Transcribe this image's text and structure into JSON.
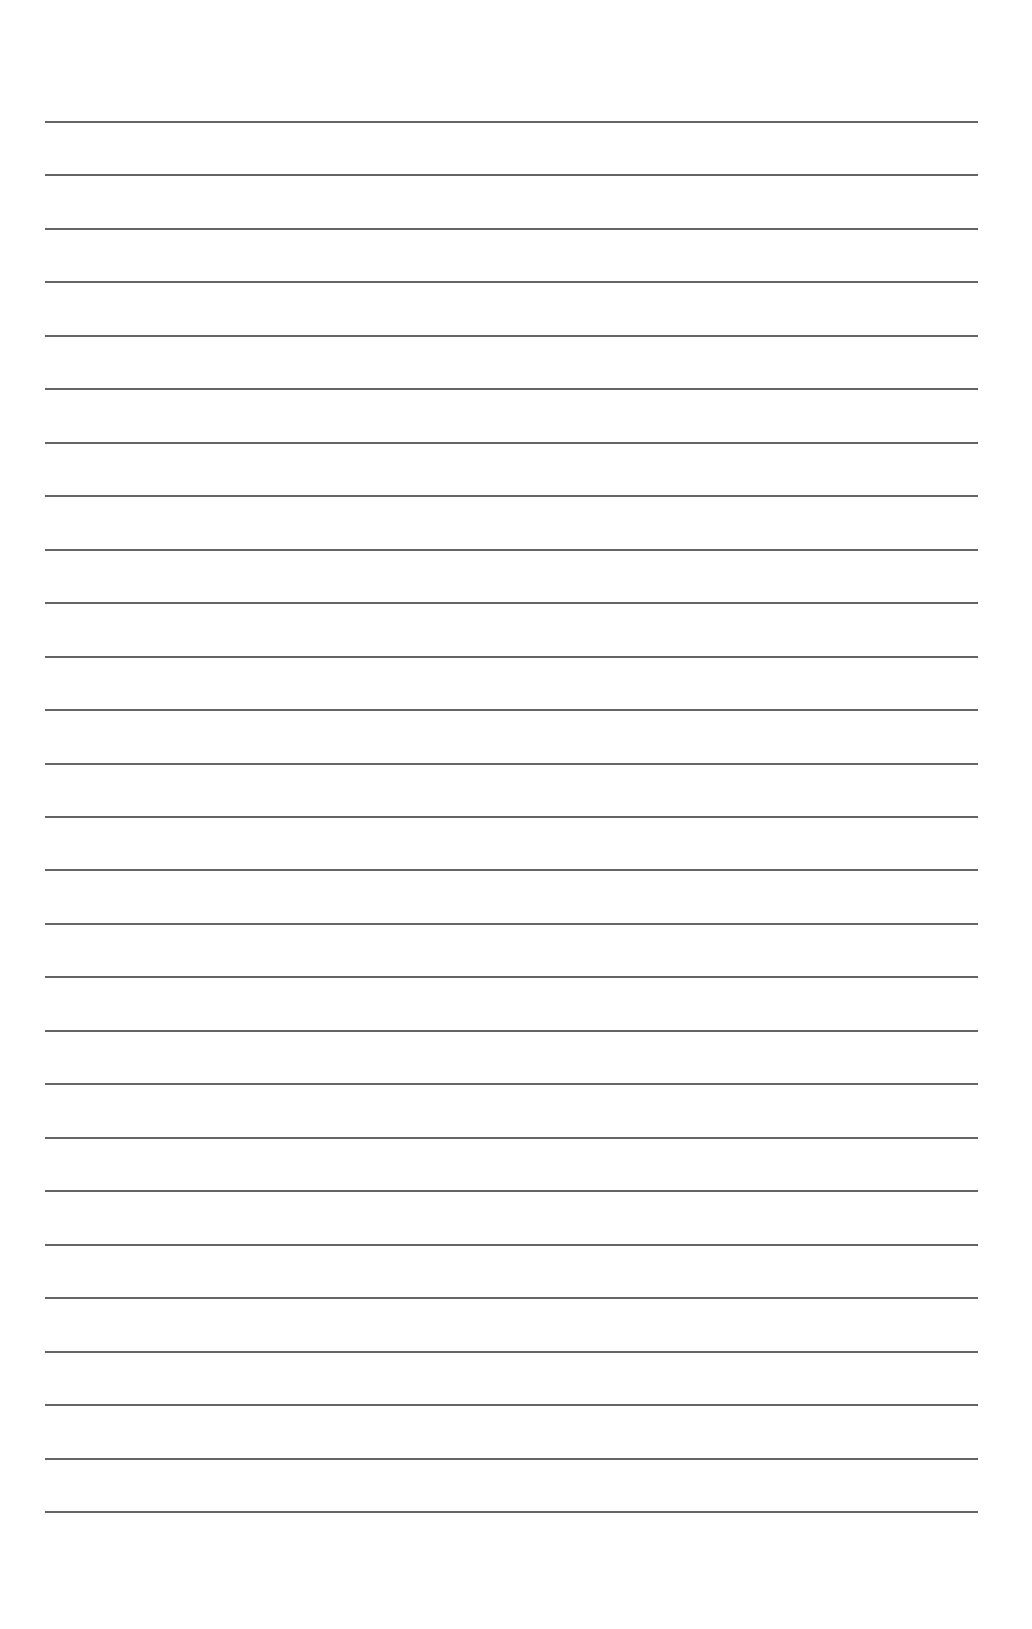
{
  "page": {
    "type": "blank ruled notebook page",
    "background_color": "#ffffff",
    "rule_color": "#4a4a4a",
    "rule_count": 27,
    "first_rule_y": 121,
    "last_rule_y": 1511,
    "rule_left_x": 45,
    "rule_right_x": 978,
    "text_content": []
  }
}
